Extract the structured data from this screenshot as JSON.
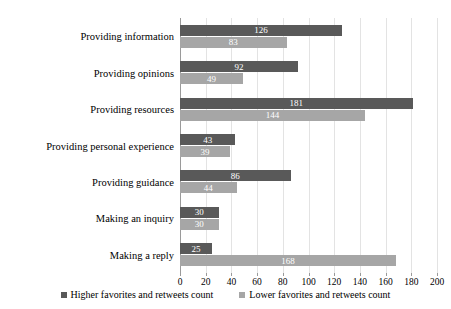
{
  "chart_data": {
    "type": "bar",
    "orientation": "horizontal",
    "title": "",
    "xlabel": "",
    "ylabel": "",
    "xlim": [
      0,
      200
    ],
    "xticks": [
      0,
      20,
      40,
      60,
      80,
      100,
      120,
      140,
      160,
      180,
      200
    ],
    "grid": true,
    "legend_position": "bottom-center",
    "categories": [
      "Providing information",
      "Providing opinions",
      "Providing resources",
      "Providing personal experience",
      "Providing guidance",
      "Making an inquiry",
      "Making a reply"
    ],
    "series": [
      {
        "name": "Higher favorites and retweets count",
        "color": "#595959",
        "values": [
          126,
          92,
          181,
          43,
          86,
          30,
          25
        ]
      },
      {
        "name": "Lower favorites and retweets count",
        "color": "#a6a6a6",
        "values": [
          83,
          49,
          144,
          39,
          44,
          30,
          168
        ]
      }
    ]
  },
  "colors": {
    "higher": "#595959",
    "lower": "#a6a6a6",
    "gridline": "#e3e3e3",
    "axis": "#9a9a9a",
    "background": "#ffffff",
    "label_text": "#ffffff",
    "text": "#000000"
  }
}
